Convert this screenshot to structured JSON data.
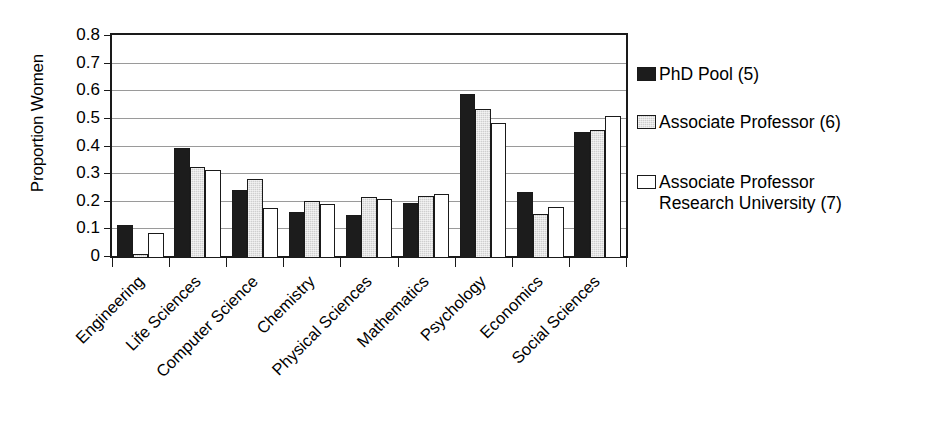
{
  "chart_data": {
    "type": "bar",
    "title": "",
    "xlabel": "",
    "ylabel": "Proportion Women",
    "ylim": [
      0,
      0.8
    ],
    "ytick_labels": [
      "0",
      "0.1",
      "0.2",
      "0.3",
      "0.4",
      "0.5",
      "0.6",
      "0.7",
      "0.8"
    ],
    "ytick_values": [
      0,
      0.1,
      0.2,
      0.3,
      0.4,
      0.5,
      0.6,
      0.7,
      0.8
    ],
    "grid": "horizontal",
    "legend_position": "right",
    "xtick_rotation": -45,
    "categories": [
      "Engineering",
      "Life Sciences",
      "Computer Science",
      "Chemistry",
      "Physical Sciences",
      "Mathematics",
      "Psychology",
      "Economics",
      "Social Sciences"
    ],
    "series": [
      {
        "name": "PhD Pool (5)",
        "color": "#1c1c1c",
        "values": [
          0.12,
          0.4,
          0.245,
          0.165,
          0.155,
          0.2,
          0.595,
          0.24,
          0.455
        ]
      },
      {
        "name": "Associate Professor (6)",
        "color": "#cfcfcf",
        "values": [
          0.015,
          0.33,
          0.285,
          0.205,
          0.22,
          0.225,
          0.54,
          0.16,
          0.465
        ]
      },
      {
        "name": "Associate Professor\nResearch University (7)",
        "color": "#ffffff",
        "values": [
          0.09,
          0.32,
          0.18,
          0.195,
          0.215,
          0.23,
          0.49,
          0.185,
          0.515
        ]
      }
    ]
  },
  "legend": {
    "items": [
      {
        "label": "PhD Pool (5)",
        "swatch": "black-filled-swatch"
      },
      {
        "label": "Associate Professor (6)",
        "swatch": "gray-filled-swatch"
      },
      {
        "label": "Associate Professor\nResearch University (7)",
        "swatch": "white-filled-swatch"
      }
    ]
  }
}
